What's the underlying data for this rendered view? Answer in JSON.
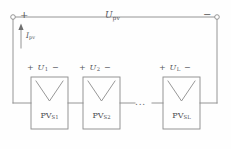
{
  "figure": {
    "type": "circuit-schematic",
    "line_color": "#8a8a8a",
    "text_color": "#55555a",
    "background": "#fefefe"
  },
  "terminals": {
    "positive": {
      "sign": "+",
      "marker": "terminal-circle"
    },
    "negative": {
      "sign": "−",
      "marker": "terminal-circle"
    }
  },
  "string_voltage": {
    "symbol": "U",
    "subscript": "pv",
    "text": "U pv"
  },
  "string_current": {
    "symbol": "I",
    "subscript": "pv",
    "text": "I pv",
    "arrow_direction": "up"
  },
  "ellipsis": "...",
  "modules": [
    {
      "label_symbol": "PV",
      "label_subscript": "S1",
      "voltage_plus": "+",
      "voltage_symbol": "U",
      "voltage_subscript": "1",
      "voltage_minus": "−"
    },
    {
      "label_symbol": "PV",
      "label_subscript": "S2",
      "voltage_plus": "+",
      "voltage_symbol": "U",
      "voltage_subscript": "2",
      "voltage_minus": "−"
    },
    {
      "label_symbol": "PV",
      "label_subscript": "SL",
      "voltage_plus": "+",
      "voltage_symbol": "U",
      "voltage_subscript": "L",
      "voltage_minus": "−"
    }
  ]
}
